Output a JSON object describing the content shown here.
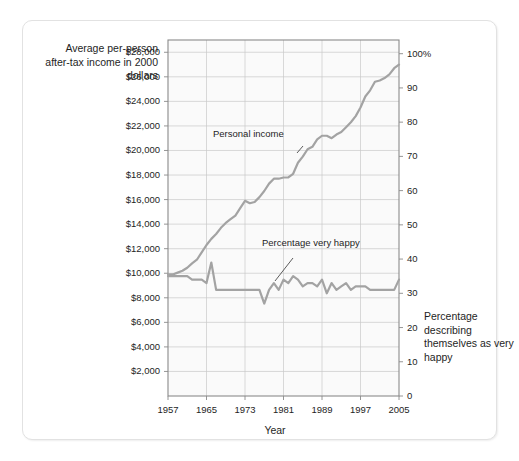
{
  "figure": {
    "background_color": "#ffffff",
    "card_border_color": "#e2e2e2",
    "plot_background_color": "#fafafa",
    "grid_color": "#c9c9c9",
    "axis_color": "#8a8a8a",
    "line_color": "#a3a3a3",
    "text_color": "#1e1e1e"
  },
  "chart_data": {
    "type": "line",
    "title": "",
    "subtitle": "",
    "xlabel": "Year",
    "ylabel": "Average per-person after-tax income in 2000 dollars",
    "y2label": "Percentage describing themselves as very happy",
    "grid": true,
    "legend_position": "inline-annotations",
    "xlim": [
      1957,
      2005
    ],
    "xticks": [
      1957,
      1965,
      1973,
      1981,
      1989,
      1997,
      2005
    ],
    "xtick_labels": [
      "1957",
      "1965",
      "1973",
      "1981",
      "1989",
      "1997",
      "2005"
    ],
    "ylim": [
      0,
      29000
    ],
    "yticks": [
      2000,
      4000,
      6000,
      8000,
      10000,
      12000,
      14000,
      16000,
      18000,
      20000,
      22000,
      24000,
      26000,
      28000
    ],
    "ytick_labels": [
      "$2,000",
      "$4,000",
      "$6,000",
      "$8,000",
      "$10,000",
      "$12,000",
      "$14,000",
      "$16,000",
      "$18,000",
      "$20,000",
      "$22,000",
      "$24,000",
      "$26,000",
      "$28,000"
    ],
    "y2lim": [
      0,
      104
    ],
    "y2ticks": [
      0,
      10,
      20,
      30,
      40,
      50,
      60,
      70,
      80,
      90,
      100
    ],
    "y2tick_labels": [
      "0",
      "10",
      "20",
      "30",
      "40",
      "50",
      "60",
      "70",
      "80",
      "90",
      "100%"
    ],
    "annotations": [
      {
        "text": "Personal income",
        "x": 1977,
        "y": 21300
      },
      {
        "text": "Percentage very happy",
        "x": 1984,
        "y": 12200
      }
    ],
    "series": [
      {
        "name": "Personal income",
        "axis": "left",
        "units": "2000 dollars",
        "x": [
          1957,
          1958,
          1959,
          1960,
          1961,
          1962,
          1963,
          1964,
          1965,
          1966,
          1967,
          1968,
          1969,
          1970,
          1971,
          1972,
          1973,
          1974,
          1975,
          1976,
          1977,
          1978,
          1979,
          1980,
          1981,
          1982,
          1983,
          1984,
          1985,
          1986,
          1987,
          1988,
          1989,
          1990,
          1991,
          1992,
          1993,
          1994,
          1995,
          1996,
          1997,
          1998,
          1999,
          2000,
          2001,
          2002,
          2003,
          2004,
          2005
        ],
        "values": [
          9900,
          9900,
          10050,
          10200,
          10450,
          10800,
          11100,
          11700,
          12300,
          12800,
          13200,
          13700,
          14100,
          14400,
          14700,
          15300,
          15900,
          15700,
          15800,
          16200,
          16700,
          17300,
          17700,
          17700,
          17800,
          17800,
          18100,
          19000,
          19500,
          20100,
          20300,
          20900,
          21200,
          21200,
          21000,
          21300,
          21500,
          21900,
          22300,
          22800,
          23500,
          24400,
          24900,
          25600,
          25700,
          25900,
          26200,
          26700,
          27000
        ]
      },
      {
        "name": "Percentage very happy",
        "axis": "right",
        "units": "percent",
        "x": [
          1957,
          1958,
          1959,
          1960,
          1961,
          1962,
          1963,
          1964,
          1965,
          1966,
          1967,
          1968,
          1969,
          1970,
          1971,
          1972,
          1973,
          1974,
          1975,
          1976,
          1977,
          1978,
          1979,
          1980,
          1981,
          1982,
          1983,
          1984,
          1985,
          1986,
          1987,
          1988,
          1989,
          1990,
          1991,
          1992,
          1993,
          1994,
          1995,
          1996,
          1997,
          1998,
          1999,
          2000,
          2001,
          2002,
          2003,
          2004,
          2005
        ],
        "values": [
          35,
          35,
          35,
          35,
          35,
          34,
          34,
          34,
          33,
          39,
          31,
          31,
          31,
          31,
          31,
          31,
          31,
          31,
          31,
          31,
          27,
          31,
          33,
          31,
          34,
          33,
          35,
          34,
          32,
          33,
          33,
          32,
          34,
          30,
          33,
          31,
          32,
          33,
          31,
          32,
          32,
          32,
          31,
          31,
          31,
          31,
          31,
          31,
          34
        ]
      }
    ]
  }
}
